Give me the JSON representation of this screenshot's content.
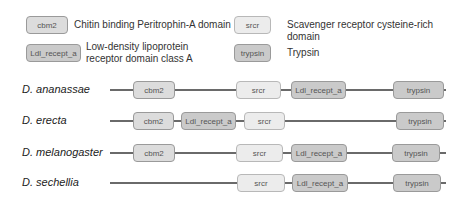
{
  "legend": [
    {
      "id": "cbm2",
      "label": "cbm2",
      "description": "Chitin binding Peritrophin-A domain",
      "fill": "#dcdcdc"
    },
    {
      "id": "srcr",
      "label": "srcr",
      "description": "Scavenger receptor cysteine-rich domain",
      "fill": "#ececec"
    },
    {
      "id": "ldl",
      "label": "Ldl_recept_a",
      "description_line1": "Low-density lipoprotein",
      "description_line2": "receptor domain class A",
      "fill": "#cacaca"
    },
    {
      "id": "trypsin",
      "label": "trypsin",
      "description": "Trypsin",
      "fill": "#cacaca"
    }
  ],
  "species": [
    {
      "name": "D. ananassae",
      "domains": [
        {
          "label": "cbm2"
        },
        {
          "label": "srcr"
        },
        {
          "label": "Ldl_recept_a"
        },
        {
          "label": "trypsin"
        }
      ]
    },
    {
      "name": "D. erecta",
      "domains": [
        {
          "label": "cbm2"
        },
        {
          "label": "Ldl_recept_a"
        },
        {
          "label": "srcr"
        },
        {
          "label": "trypsin"
        }
      ]
    },
    {
      "name": "D. melanogaster",
      "domains": [
        {
          "label": "cbm2"
        },
        {
          "label": "srcr"
        },
        {
          "label": "Ldl_recept_a"
        },
        {
          "label": "trypsin"
        }
      ]
    },
    {
      "name": "D. sechellia",
      "domains": [
        {
          "label": "srcr"
        },
        {
          "label": "Ldl_recept_a"
        },
        {
          "label": "trypsin"
        }
      ]
    }
  ]
}
